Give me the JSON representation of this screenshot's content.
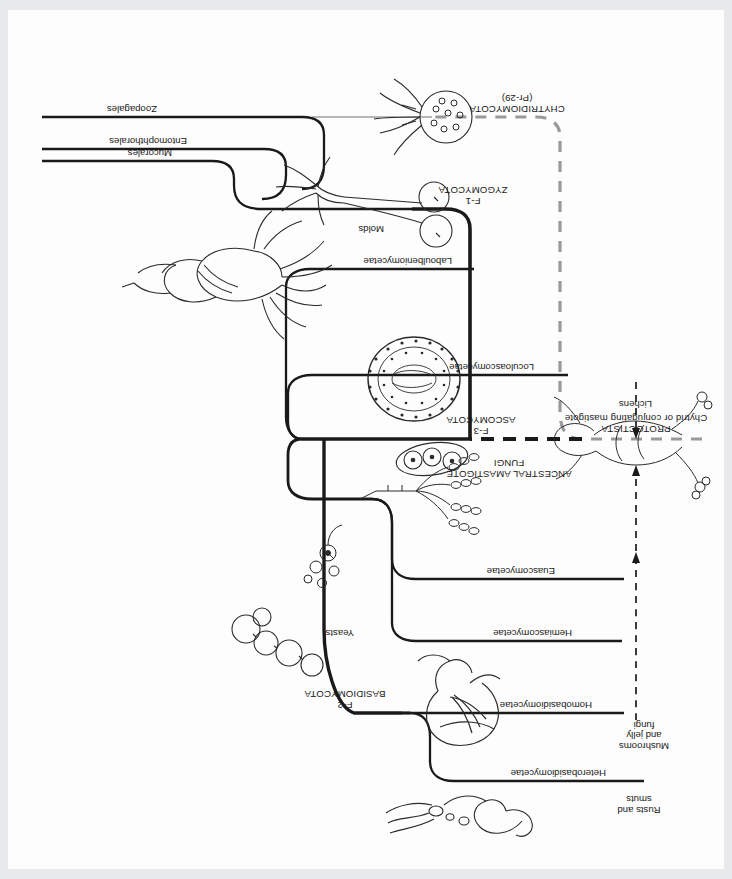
{
  "figure": {
    "kind": "phylogenetic-tree",
    "orientation_note": "page is scanned upside down (rotated 180 degrees)"
  },
  "root": {
    "label_line1": "PROTOCTISTA",
    "label_line2": "Chytrid or conjugating mastigote"
  },
  "ancestor": {
    "label_line1": "ANCESTRAL AMASTIGOTE",
    "label_line2": "FUNGI"
  },
  "phyla": [
    {
      "code": "F-2",
      "name": "BASIDIOMYCOTA"
    },
    {
      "code": "F-3",
      "name": "ASCOMYCOTA"
    },
    {
      "code": "F-1",
      "name": "ZYGOMYCOTA"
    },
    {
      "code": "",
      "name": "CHYTRIDIOMYCOTA",
      "sub": "(Pr-29)"
    }
  ],
  "classes": [
    {
      "name": "Heterobasidiomycetae",
      "common_line1": "Rusts and",
      "common_line2": "smuts"
    },
    {
      "name": "Homobasidiomycetae",
      "common_line1": "Mushrooms",
      "common_line2": "and jelly",
      "common_line3": "fungi"
    },
    {
      "name": "Hemiascomycetae",
      "common_line1": "Yeasts"
    },
    {
      "name": "Euascomycetae",
      "common_line1": ""
    },
    {
      "name": "Loculoascomycetae",
      "common_line1": ""
    },
    {
      "name": "Laboulbeniomycetae",
      "common_line1": ""
    },
    {
      "name": "Mucorales",
      "common_line1": ""
    },
    {
      "name": "Entomophthorales",
      "common_line1": ""
    },
    {
      "name": "Zoopagales",
      "common_line1": ""
    }
  ],
  "annotations": [
    {
      "name": "Lichens"
    },
    {
      "name": "Molds"
    }
  ],
  "colors": {
    "line": "#1a1a1a",
    "dashed_grey": "#9a9a9a",
    "background": "#fdfdfd",
    "text": "#1a1a1a"
  }
}
